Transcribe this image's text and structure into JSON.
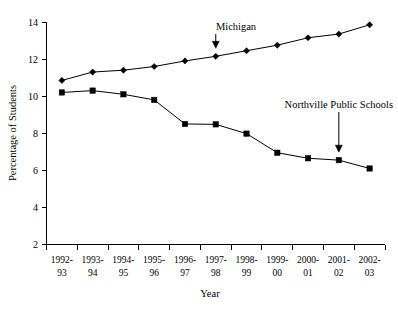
{
  "chart_data": {
    "type": "line",
    "title": "",
    "xlabel": "Year",
    "ylabel": "Percentage of Students",
    "ylim": [
      2,
      14
    ],
    "yticks": [
      2,
      4,
      6,
      8,
      10,
      12,
      14
    ],
    "grid": false,
    "legend_position": "none",
    "categories": [
      "1992-\n93",
      "1993-\n94",
      "1994-\n95",
      "1995-\n96",
      "1996-\n97",
      "1997-\n98",
      "1998-\n99",
      "1999-\n00",
      "2000-\n01",
      "2001-\n02",
      "2002-\n03"
    ],
    "categories_line1": [
      "1992-",
      "1993-",
      "1994-",
      "1995-",
      "1996-",
      "1997-",
      "1998-",
      "1999-",
      "2000-",
      "2001-",
      "2002-"
    ],
    "categories_line2": [
      "93",
      "94",
      "95",
      "96",
      "97",
      "98",
      "99",
      "00",
      "01",
      "02",
      "03"
    ],
    "series": [
      {
        "name": "Michigan",
        "marker": "diamond",
        "values": [
          10.85,
          11.3,
          11.4,
          11.6,
          11.9,
          12.15,
          12.45,
          12.75,
          13.15,
          13.35,
          13.85
        ]
      },
      {
        "name": "Northville Public Schools",
        "marker": "square",
        "values": [
          10.2,
          10.3,
          10.1,
          9.8,
          8.5,
          8.48,
          7.98,
          6.95,
          6.65,
          6.55,
          6.1
        ]
      }
    ],
    "annotations": [
      {
        "text": "Michigan",
        "target_category": "1997-\n98",
        "target_value": 12.15
      },
      {
        "text": "Northville Public Schools",
        "target_category": "2001-\n02",
        "target_value": 6.55
      }
    ],
    "colors": {
      "line": "#000000",
      "marker": "#000000",
      "axis": "#000000",
      "background": "#ffffff"
    }
  }
}
